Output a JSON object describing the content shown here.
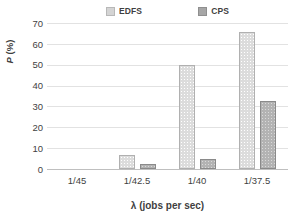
{
  "chart_data": {
    "type": "bar",
    "title": "",
    "categories": [
      "1/45",
      "1/42.5",
      "1/40",
      "1/37.5"
    ],
    "series": [
      {
        "name": "EDFS",
        "values": [
          0,
          6.7,
          50,
          65.7
        ],
        "color": "#dcdcdc"
      },
      {
        "name": "CPS",
        "values": [
          0,
          2.2,
          4.8,
          32.4
        ],
        "color": "#b3b3b3"
      }
    ],
    "xlabel": "λ (jobs per sec)",
    "ylabel": "P (%)",
    "ylim": [
      0,
      70
    ],
    "ytick_values": [
      70,
      60,
      50,
      40,
      30,
      20,
      10,
      0
    ],
    "ytick_labels": [
      "70",
      "60",
      "50",
      "40",
      "30",
      "20",
      "10",
      "0"
    ],
    "grid": "horizontal",
    "legend_position": "top-center",
    "legend_entries": [
      "EDFS",
      "CPS"
    ]
  },
  "axes": {
    "y_title_italic": "P",
    "y_title_unit": " (%)",
    "x_title": "λ (jobs per sec)"
  }
}
